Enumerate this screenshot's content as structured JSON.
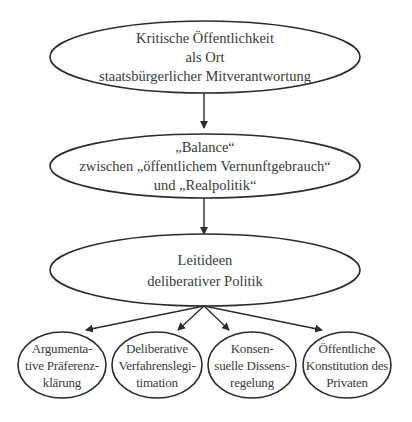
{
  "diagram": {
    "colors": {
      "stroke": "#2b2b2b",
      "text": "#3a3a3a",
      "background": "#ffffff"
    },
    "nodes": {
      "top": {
        "lines": [
          "Kritische Öffentlichkeit",
          "als Ort",
          "staatsbürgerlicher Mitverantwortung"
        ]
      },
      "middle": {
        "lines": [
          "„Balance“",
          "zwischen „öffentlichem Vernunftgebrauch“",
          "und „Realpolitik“"
        ]
      },
      "lower": {
        "lines": [
          "Leitideen",
          "deliberativer Politik"
        ]
      },
      "leaves": [
        {
          "lines": [
            "Argumenta-",
            "tive Präferenz-",
            "klärung"
          ]
        },
        {
          "lines": [
            "Deliberative",
            "Verfahrenslegi-",
            "timation"
          ]
        },
        {
          "lines": [
            "Konsen-",
            "suelle Dissens-",
            "regelung"
          ]
        },
        {
          "lines": [
            "Öffentliche",
            "Konstitution des",
            "Privaten"
          ]
        }
      ]
    },
    "edges": [
      {
        "from": "top",
        "to": "middle"
      },
      {
        "from": "middle",
        "to": "lower"
      },
      {
        "from": "lower",
        "to": "leaf-1"
      },
      {
        "from": "lower",
        "to": "leaf-2"
      },
      {
        "from": "lower",
        "to": "leaf-3"
      },
      {
        "from": "lower",
        "to": "leaf-4"
      }
    ]
  }
}
